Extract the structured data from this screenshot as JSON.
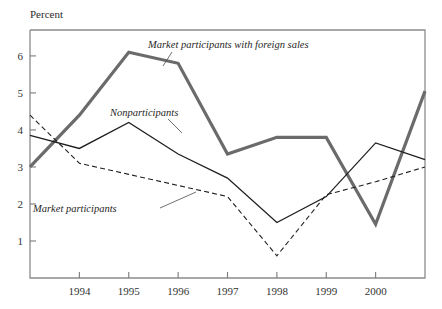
{
  "chart_data": {
    "type": "line",
    "title": "",
    "ylabel": "Percent",
    "xlabel": "",
    "ylim": [
      0,
      6.7
    ],
    "xlim": [
      1993,
      2001
    ],
    "yticks": [
      1,
      2,
      3,
      4,
      5,
      6
    ],
    "ytick_labels": [
      "1",
      "2",
      "3",
      "4",
      "5",
      "6"
    ],
    "xticks": [
      1994,
      1995,
      1996,
      1997,
      1998,
      1999,
      2000
    ],
    "xtick_labels": [
      "1994",
      "1995",
      "1996",
      "1997",
      "1998",
      "1999",
      "2000"
    ],
    "grid": false,
    "legend_position": "inline-annotations",
    "x": [
      1993,
      1994,
      1995,
      1996,
      1997,
      1998,
      1999,
      2000,
      2001
    ],
    "series": [
      {
        "name": "Market participants with foreign sales",
        "style": "thick-solid-gray",
        "color": "#6b6b6b",
        "values": [
          3.0,
          4.4,
          6.1,
          5.8,
          3.35,
          3.8,
          3.8,
          1.45,
          5.05
        ]
      },
      {
        "name": "Nonparticipants",
        "style": "thin-solid-black",
        "color": "#1f1f1f",
        "values": [
          3.85,
          3.5,
          4.2,
          3.35,
          2.7,
          1.5,
          2.2,
          3.65,
          3.2
        ]
      },
      {
        "name": "Market participants",
        "style": "thin-dashed-black",
        "color": "#1f1f1f",
        "values": [
          4.4,
          3.1,
          2.8,
          2.5,
          2.2,
          0.6,
          2.25,
          2.6,
          3.0
        ]
      }
    ],
    "annotations": [
      {
        "text": "Market participants with foreign sales",
        "x": 148,
        "y": 48,
        "leader": "M 172 52 L 163 66"
      },
      {
        "text": "Nonparticipants",
        "x": 110,
        "y": 116,
        "leader": "M 168 119 L 182 133"
      },
      {
        "text": "Market participants",
        "x": 33,
        "y": 212,
        "leader": "M 160 208 L 196 192"
      }
    ]
  },
  "axis": {
    "percent_label": "Percent"
  }
}
